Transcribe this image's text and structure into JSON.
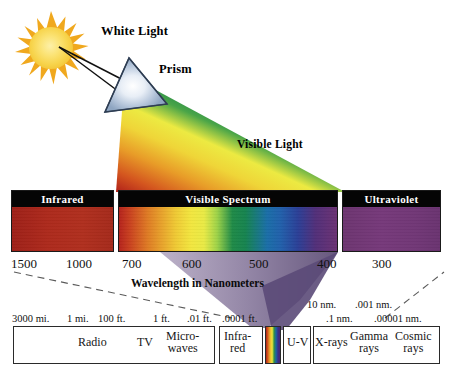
{
  "top_diagram": {
    "sun": {
      "icon": "sun-icon"
    },
    "white_light_label": "White Light",
    "prism_label": "Prism",
    "visible_light_label": "Visible Light"
  },
  "spectrum_panels": [
    {
      "name": "infrared",
      "header": "Infrared"
    },
    {
      "name": "visible",
      "header": "Visible Spectrum"
    },
    {
      "name": "ultraviolet",
      "header": "Ultraviolet"
    }
  ],
  "wavelength_axis": {
    "caption": "Wavelength in Nanometers",
    "ticks": [
      {
        "label": "1500",
        "x": 11
      },
      {
        "label": "1000",
        "x": 66
      },
      {
        "label": "700",
        "x": 122
      },
      {
        "label": "600",
        "x": 182
      },
      {
        "label": "500",
        "x": 249
      },
      {
        "label": "400",
        "x": 317
      },
      {
        "label": "300",
        "x": 372
      }
    ],
    "unit": "nanometers"
  },
  "em_scale": {
    "segments": [
      {
        "label": "Radio",
        "name": "radio"
      },
      {
        "label": "TV",
        "name": "tv"
      },
      {
        "label": "Micro-\nwaves",
        "name": "microwaves"
      },
      {
        "label": "Infra-\nred",
        "name": "infrared"
      },
      {
        "label": "U-V",
        "name": "ultraviolet"
      },
      {
        "label": "X-rays",
        "name": "x-rays"
      },
      {
        "label": "Gamma\nrays",
        "name": "gamma-rays"
      },
      {
        "label": "Cosmic\nrays",
        "name": "cosmic-rays"
      }
    ],
    "measures_left": [
      {
        "label": "3000 mi.",
        "x": 12
      },
      {
        "label": "1 mi.",
        "x": 67
      },
      {
        "label": "100 ft.",
        "x": 98
      },
      {
        "label": "1 ft.",
        "x": 153
      },
      {
        "label": ".01 ft.",
        "x": 187
      },
      {
        "label": ".0001 ft.",
        "x": 222
      }
    ],
    "measures_right_upper": [
      {
        "label": "10 nm.",
        "x": 307
      },
      {
        "label": ".001 nm.",
        "x": 355
      }
    ],
    "measures_right_lower": [
      {
        "label": ".1 nm.",
        "x": 326
      },
      {
        "label": ".00001 nm.",
        "x": 374
      }
    ]
  },
  "colors": {
    "sun_core": "#f7d34a",
    "sun_rays": "#f0a81e",
    "prism_fill": "#9fb4cf",
    "header_bar": "#050505",
    "header_text": "#ffffff",
    "infrared_band": "#ad2a1c",
    "ultraviolet_band": "#73387a",
    "text": "#111111",
    "border": "#2a2a2a"
  }
}
